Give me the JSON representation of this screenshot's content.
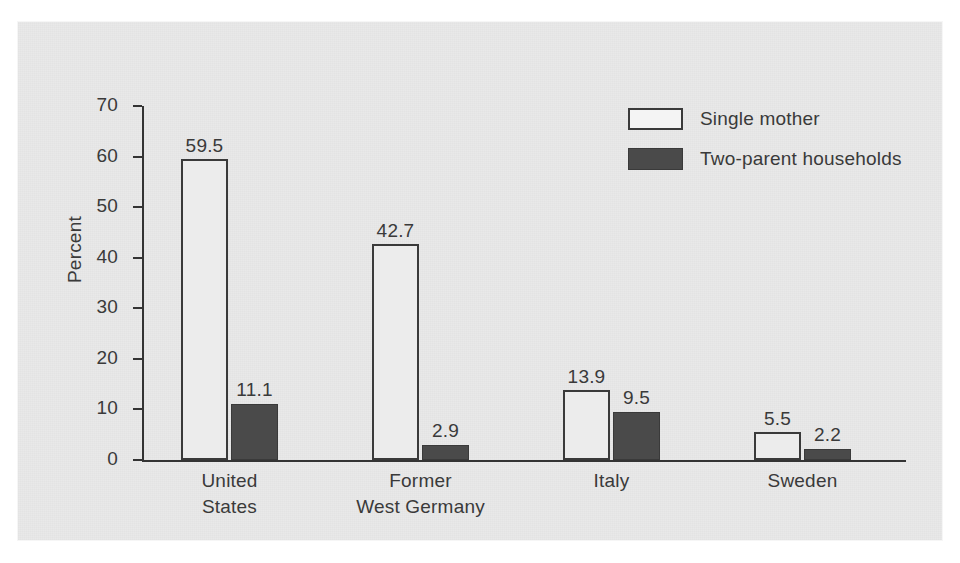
{
  "chart_data": {
    "type": "bar",
    "title": "",
    "xlabel": "",
    "ylabel": "Percent",
    "ylim": [
      0,
      70
    ],
    "ytick_step": 10,
    "yticks": [
      0,
      10,
      20,
      30,
      40,
      50,
      60,
      70
    ],
    "ytick_labels": [
      "0",
      "10",
      "20",
      "30",
      "40",
      "50",
      "60",
      "70"
    ],
    "grid": false,
    "legend_position": "top-right",
    "categories": [
      "United States",
      "Former West Germany",
      "Italy",
      "Sweden"
    ],
    "category_label_lines": [
      [
        "United",
        "States"
      ],
      [
        "Former",
        "West Germany"
      ],
      [
        "Italy"
      ],
      [
        "Sweden"
      ]
    ],
    "series": [
      {
        "name": "Single mother",
        "color": "#ececec",
        "edge_color": "#3a3a3a",
        "values": [
          59.5,
          42.7,
          13.9,
          5.5
        ],
        "value_labels": [
          "59.5",
          "42.7",
          "13.9",
          "5.5"
        ]
      },
      {
        "name": "Two-parent households",
        "color": "#4a4a4a",
        "edge_color": "#3a3a3a",
        "values": [
          11.1,
          2.9,
          9.5,
          2.2
        ],
        "value_labels": [
          "11.1",
          "2.9",
          "9.5",
          "2.2"
        ]
      }
    ]
  },
  "colors": {
    "panel_background": "#e9e9e9",
    "page_background": "#ffffff",
    "axis": "#333333",
    "text": "#3a3a3a",
    "series_light": "#ececec",
    "series_dark": "#4a4a4a"
  }
}
